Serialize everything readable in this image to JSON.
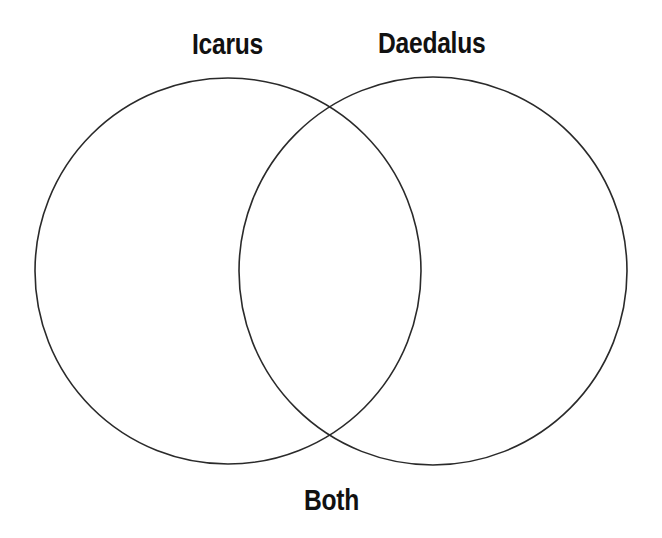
{
  "diagram": {
    "type": "venn",
    "sets": [
      {
        "label": "Icarus",
        "cx": 228,
        "cy": 271,
        "r": 193
      },
      {
        "label": "Daedalus",
        "cx": 433,
        "cy": 271,
        "r": 194
      }
    ],
    "intersection_label": "Both",
    "stroke_color": "#2a2a2a",
    "background_color": "#ffffff"
  }
}
